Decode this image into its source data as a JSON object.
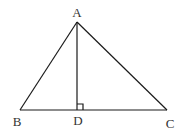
{
  "diagram": {
    "type": "geometry-triangle-with-altitude",
    "points": {
      "A": {
        "label": "A",
        "x": 77,
        "y": 22,
        "label_x": 77,
        "label_y": 17
      },
      "B": {
        "label": "B",
        "x": 20,
        "y": 110,
        "label_x": 17,
        "label_y": 126
      },
      "C": {
        "label": "C",
        "x": 167,
        "y": 110,
        "label_x": 170,
        "label_y": 128
      },
      "D": {
        "label": "D",
        "x": 77,
        "y": 110,
        "label_x": 78,
        "label_y": 125
      }
    },
    "segments": [
      "AB",
      "AC",
      "BC",
      "AD"
    ],
    "right_angle_at": "D",
    "right_angle_size": 6,
    "line_color": "#1a1a1a",
    "label_color": "#333333"
  }
}
